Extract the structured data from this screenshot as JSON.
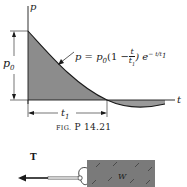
{
  "figure": {
    "caption_prefix": "FIG.",
    "caption_number": "P 14.21",
    "graph": {
      "vertical_axis_label": "p",
      "horizontal_axis_label": "t",
      "amplitude_label": "p",
      "amplitude_subscript": "0",
      "duration_label": "t",
      "duration_subscript": "1",
      "equation": {
        "lhs": "p = p",
        "lhs_sub": "0",
        "open": "(1 −",
        "frac_num": "t",
        "frac_den": "t",
        "frac_den_sub": "1",
        "close": ") e",
        "exponent": "− t/t",
        "exponent_sub": "1"
      },
      "fill_color": "#8c8c8c",
      "line_color": "#1a1a1a"
    },
    "sketch": {
      "force_label": "T",
      "block_label": "W",
      "block_color": "#7a7a7a"
    }
  }
}
